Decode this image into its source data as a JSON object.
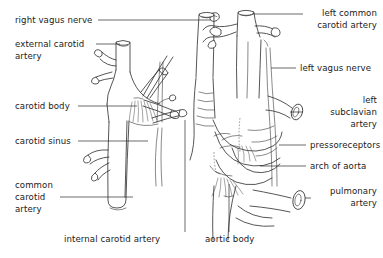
{
  "figure": {
    "background_color": "#ffffff",
    "ink_color": "#2b2b2b"
  },
  "labels": {
    "right_vagus_nerve": "right vagus nerve",
    "external_carotid_artery_line1": "external carotid",
    "external_carotid_artery_line2": "artery",
    "carotid_body": "carotid body",
    "carotid_sinus": "carotid sinus",
    "common_carotid_artery_line1": "common",
    "common_carotid_artery_line2": "carotid",
    "common_carotid_artery_line3": "artery",
    "internal_carotid_artery": "internal carotid artery",
    "left_common_carotid_artery_line1": "left common",
    "left_common_carotid_artery_line2": "carotid artery",
    "left_vagus_nerve": "left vagus nerve",
    "left_subclavian_artery_line1": "left",
    "left_subclavian_artery_line2": "subclavian",
    "left_subclavian_artery_line3": "artery",
    "pressoreceptors": "pressoreceptors",
    "arch_of_aorta": "arch of aorta",
    "pulmonary_artery_line1": "pulmonary",
    "pulmonary_artery_line2": "artery",
    "aortic_body": "aortic body"
  }
}
